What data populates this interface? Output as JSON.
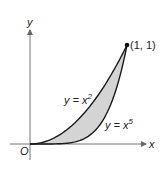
{
  "figure": {
    "axis_x_label": "x",
    "axis_y_label": "y",
    "origin_label": "O",
    "point_label": "(1, 1)",
    "curve_upper": {
      "prefix": "y = x",
      "exponent": "2"
    },
    "curve_lower": {
      "prefix": "y = x",
      "exponent": "5"
    },
    "colors": {
      "curve": "#1a1a1a",
      "fill": "#d4d4d4",
      "axis": "#666666"
    }
  },
  "chart_data": {
    "type": "area",
    "title": "",
    "xlabel": "x",
    "ylabel": "y",
    "series": [
      {
        "name": "y = x^2",
        "x": [
          0,
          0.25,
          0.5,
          0.75,
          1
        ],
        "values": [
          0,
          0.0625,
          0.25,
          0.5625,
          1
        ]
      },
      {
        "name": "y = x^5",
        "x": [
          0,
          0.25,
          0.5,
          0.75,
          1
        ],
        "values": [
          0,
          0.001,
          0.03125,
          0.2373,
          1
        ]
      }
    ],
    "annotations": [
      "(1, 1)",
      "O"
    ],
    "shaded_region": "between y = x^2 and y = x^5 for 0 ≤ x ≤ 1"
  }
}
